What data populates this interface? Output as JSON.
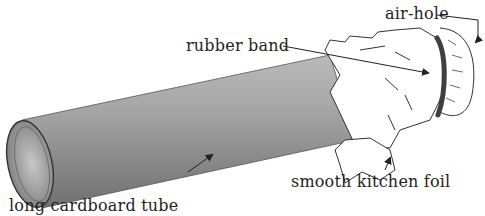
{
  "diagram": {
    "labels": {
      "air_hole": "air-hole",
      "rubber_band": "rubber band",
      "foil": "smooth kitchen foil",
      "tube": "long cardboard tube"
    }
  }
}
